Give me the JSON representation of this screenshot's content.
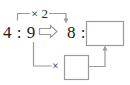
{
  "diagram": {
    "type": "ratio-equivalence",
    "left_ratio": {
      "antecedent": "4",
      "separator": ":",
      "consequent": "9",
      "display": "4 : 9"
    },
    "transform_arrow": {
      "glyph": "right-block-arrow",
      "symbol": "⇒"
    },
    "right_ratio": {
      "antecedent": "8",
      "separator": ":",
      "consequent_blank": "",
      "display": "8 :"
    },
    "top_operation": {
      "label": "× 2",
      "operator": "×",
      "operand": "2",
      "from": "4",
      "to": "8"
    },
    "bottom_operation": {
      "label": "×",
      "operator": "×",
      "operand_blank": "",
      "from": "9",
      "to": "answer-box"
    },
    "answer_box": {
      "value": "",
      "label": "large empty answer box"
    },
    "factor_box": {
      "value": "",
      "label": "small empty factor box"
    },
    "colors": {
      "text": "#1b1b1b",
      "line": "#9a9a9a",
      "box_border": "#9a9a9a",
      "background": "#ffffff"
    }
  }
}
